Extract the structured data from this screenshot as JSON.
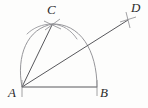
{
  "figure": {
    "background_color": "#fdfdfc",
    "stroke_color": "#6f6f72",
    "line_color": "#58585c",
    "label_color": "#2b2b2b",
    "canvas": {
      "width": 148,
      "height": 108
    }
  },
  "points": [
    {
      "id": "A",
      "label": "A",
      "x": 22,
      "y": 87,
      "role": "base-left-vertex",
      "tick": "none"
    },
    {
      "id": "B",
      "label": "B",
      "x": 97,
      "y": 87,
      "role": "base-right-vertex",
      "tick": "none"
    },
    {
      "id": "C",
      "label": "C",
      "x": 52,
      "y": 25,
      "role": "arc-intersection",
      "tick": "cross"
    },
    {
      "id": "D",
      "label": "D",
      "x": 128,
      "y": 20,
      "role": "ray-endpoint",
      "tick": "cross"
    }
  ],
  "segments": [
    {
      "id": "AB",
      "from": "A",
      "to": "B",
      "label": "base-segment"
    },
    {
      "id": "AC",
      "from": "A",
      "to": "C",
      "label": "left-side-segment"
    },
    {
      "id": "AD",
      "from": "A",
      "to": "D",
      "label": "construction-ray"
    }
  ],
  "arcs": [
    {
      "id": "arc-from-B",
      "center": "A",
      "radius": 75,
      "label": "arc-centered-at-A-through-B"
    },
    {
      "id": "arc-from-A",
      "center": "B",
      "radius": 75,
      "label": "arc-centered-at-B-through-A"
    }
  ],
  "geometry_paths": {
    "base_line": "M 22 87 L 97 87",
    "segment_AC": "M 22 87 L 52 25",
    "ray_AD": "M 22 87 L 128 20",
    "arc_center_A": "M 97 87 C 97 49 79 22 52 24",
    "arc_center_B": "M 22 87 C 17 55 28 27 53 24",
    "arc_center_A_tail": "M 52 24 C 41 24 32 28 26 35",
    "arc_center_B_tail": "M 53 24 C 63 25 71 30 76 38",
    "tick_C_1": "M 44 21 L 61 29",
    "tick_C_2": "M 45 30 L 60 19",
    "tick_D_1": "M 121 21 L 136 18",
    "tick_D_2": "M 127 13 L 130 28"
  }
}
